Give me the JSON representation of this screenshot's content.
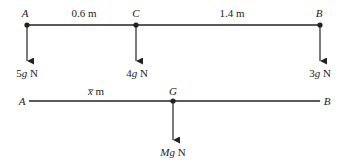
{
  "diagram": {
    "top_beam": {
      "points": [
        {
          "label": "A",
          "force": "5g N",
          "force_coef": "5",
          "force_var": "g",
          "force_unit": " N"
        },
        {
          "label": "C",
          "force": "4g N",
          "force_coef": "4",
          "force_var": "g",
          "force_unit": " N"
        },
        {
          "label": "B",
          "force": "3g N",
          "force_coef": "3",
          "force_var": "g",
          "force_unit": " N"
        }
      ],
      "distances": [
        {
          "text": "0.6 m"
        },
        {
          "text": "1.4 m"
        }
      ]
    },
    "bottom_beam": {
      "left_label": "A",
      "right_label": "B",
      "centre_label": "G",
      "distance": {
        "var": "x̅",
        "unit": " m"
      },
      "force": {
        "var": "Mg",
        "unit": " N"
      }
    },
    "colors": {
      "line": "#222222",
      "background": "#ffffff"
    }
  }
}
